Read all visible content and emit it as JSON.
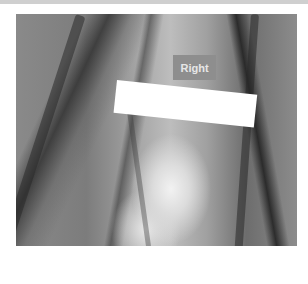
{
  "image": {
    "description": "Grayscale photograph of an anatomical specimen with an orientation label",
    "label_text": "Right",
    "redaction": "white rectangle"
  }
}
